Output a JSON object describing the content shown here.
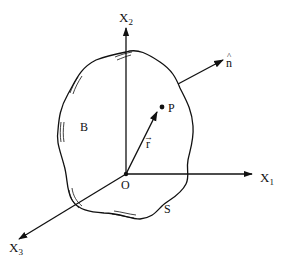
{
  "diagram": {
    "colors": {
      "stroke": "#111111",
      "background": "#ffffff"
    },
    "axes": {
      "x1": {
        "label_main": "X",
        "label_sub": "1"
      },
      "x2": {
        "label_main": "X",
        "label_sub": "2"
      },
      "x3": {
        "label_main": "X",
        "label_sub": "3"
      }
    },
    "origin": {
      "label": "O"
    },
    "body": {
      "label": "B"
    },
    "surface": {
      "label": "S"
    },
    "point": {
      "label": "P"
    },
    "position_vector": {
      "label": "r",
      "accent": "→"
    },
    "normal": {
      "label": "n",
      "accent": "^"
    }
  }
}
